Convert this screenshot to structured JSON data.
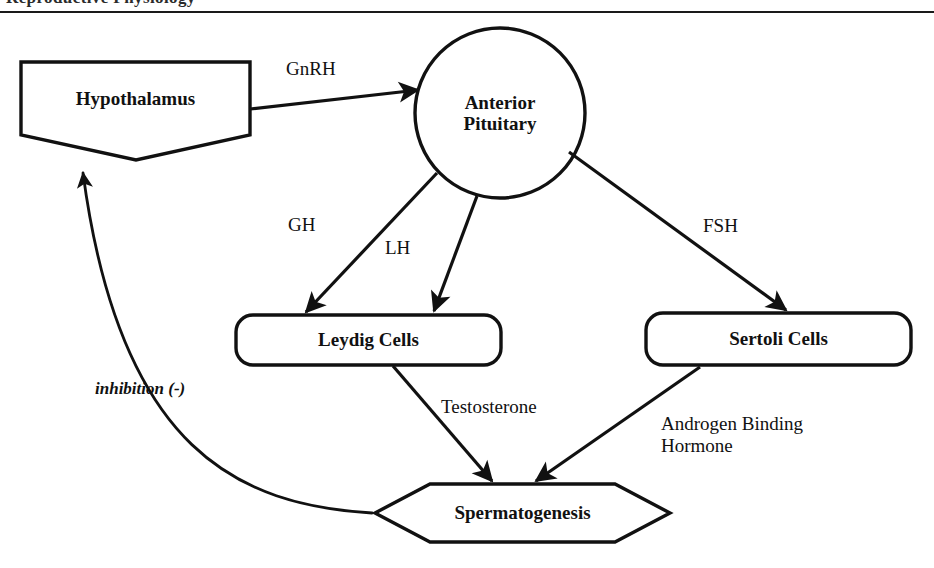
{
  "page": {
    "header_remnant_text": "Reproductive Physiology",
    "background_color": "#ffffff",
    "ink_color": "#111111"
  },
  "diagram": {
    "type": "flowchart",
    "nodes": [
      {
        "id": "hypothalamus",
        "label": "Hypothalamus",
        "shape": "pentagon-down",
        "x": 135,
        "y": 105
      },
      {
        "id": "anterior-pituitary",
        "label": "Anterior\nPituitary",
        "label_line1": "Anterior",
        "label_line2": "Pituitary",
        "shape": "circle",
        "x": 500,
        "y": 113
      },
      {
        "id": "leydig-cells",
        "label": "Leydig Cells",
        "shape": "rounded-rectangle",
        "x": 368,
        "y": 340
      },
      {
        "id": "sertoli-cells",
        "label": "Sertoli Cells",
        "shape": "rounded-rectangle",
        "x": 778,
        "y": 339
      },
      {
        "id": "spermatogenesis",
        "label": "Spermatogenesis",
        "shape": "hexagon",
        "x": 522,
        "y": 513
      }
    ],
    "edges": [
      {
        "id": "gnrh",
        "label": "GnRH",
        "from": "hypothalamus",
        "to": "anterior-pituitary",
        "arrow": "single",
        "style": "straight"
      },
      {
        "id": "gh",
        "label": "GH",
        "from": "anterior-pituitary",
        "to": "leydig-cells",
        "arrow": "single",
        "style": "straight"
      },
      {
        "id": "lh",
        "label": "LH",
        "from": "anterior-pituitary",
        "to": "leydig-cells",
        "arrow": "single",
        "style": "straight"
      },
      {
        "id": "fsh",
        "label": "FSH",
        "from": "anterior-pituitary",
        "to": "sertoli-cells",
        "arrow": "single",
        "style": "straight"
      },
      {
        "id": "testosterone",
        "label": "Testosterone",
        "from": "leydig-cells",
        "to": "spermatogenesis",
        "arrow": "single",
        "style": "straight"
      },
      {
        "id": "androgen-binding-hormone",
        "label": "Androgen Binding Hormone",
        "label_line1": "Androgen Binding",
        "label_line2": "Hormone",
        "from": "sertoli-cells",
        "to": "spermatogenesis",
        "arrow": "single",
        "style": "straight"
      },
      {
        "id": "inhibition",
        "label": "inhibition (-)",
        "from": "spermatogenesis",
        "to": "hypothalamus",
        "arrow": "single",
        "style": "curved"
      }
    ]
  }
}
